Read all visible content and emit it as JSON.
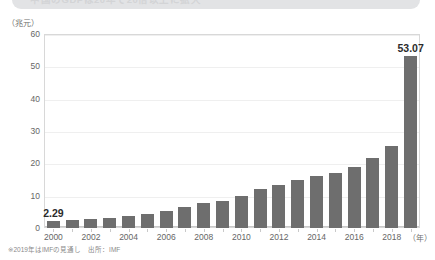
{
  "banner": {
    "text": "中国のGDPは20年で20倍以上に拡大"
  },
  "footnote": "※2019年はIMFの見通し　出所：IMF",
  "chart_data": {
    "type": "bar",
    "title": "",
    "xlabel": "（年）",
    "ylabel": "（兆元）",
    "unit_label": "（兆元）",
    "xaxis_unit": "（年）",
    "ylim": [
      0,
      60
    ],
    "ytick_step": 10,
    "yticks": [
      0,
      10,
      20,
      30,
      40,
      50,
      60
    ],
    "ytick_labels": [
      "0",
      "10",
      "20",
      "30",
      "40",
      "50",
      "60"
    ],
    "grid": "horizontal",
    "legend": "none",
    "bar_color": "#6e6e6e",
    "categories": [
      "2000",
      "2001",
      "2002",
      "2003",
      "2004",
      "2005",
      "2006",
      "2007",
      "2008",
      "2009",
      "2010",
      "2011",
      "2012",
      "2013",
      "2014",
      "2015",
      "2016",
      "2017",
      "2018",
      "2019"
    ],
    "xtick_labels": [
      "2000",
      "2002",
      "2004",
      "2006",
      "2008",
      "2010",
      "2012",
      "2014",
      "2016",
      "2018"
    ],
    "values": [
      2.29,
      2.56,
      2.83,
      3.21,
      3.79,
      4.43,
      5.26,
      6.45,
      7.68,
      8.45,
      10.05,
      11.94,
      13.29,
      14.72,
      15.96,
      17.0,
      18.8,
      21.5,
      25.5,
      53.07
    ],
    "data_labels": [
      {
        "index": 0,
        "value": "2.29"
      },
      {
        "index": 19,
        "value": "53.07"
      }
    ]
  }
}
